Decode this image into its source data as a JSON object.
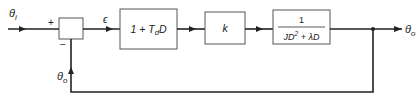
{
  "diagram": {
    "type": "closed-loop control system block diagram",
    "input_signal": {
      "symbol": "θ",
      "subscript": "i"
    },
    "output_signal": {
      "symbol": "θ",
      "subscript": "o"
    },
    "feedback_signal": {
      "symbol": "θ",
      "subscript": "o"
    },
    "summing_junction": {
      "plus_sign": "+",
      "minus_sign": "−"
    },
    "error_signal": "ϵ",
    "blocks": [
      {
        "id": "derivative-controller",
        "text_prefix": "1 + T",
        "subscript": "d",
        "text_suffix": "D"
      },
      {
        "id": "gain",
        "text": "k"
      },
      {
        "id": "plant",
        "numerator": "1",
        "denominator_a": "JD",
        "denominator_exp": "2",
        "denominator_b": " + λD"
      }
    ],
    "colors": {
      "line": "#222222",
      "box_border": "#555555",
      "background": "#ffffff"
    }
  }
}
